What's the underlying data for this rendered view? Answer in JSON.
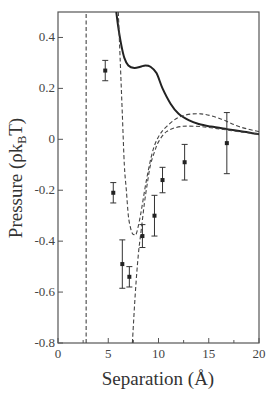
{
  "chart_data": {
    "type": "line",
    "title": "",
    "xlabel": "Separation (Å)",
    "ylabel": "Pressure (ρk_BT)",
    "ylabel_parts": {
      "main": "Pressure (ρk",
      "sub": "B",
      "end": "T)"
    },
    "xlim": [
      0,
      20
    ],
    "ylim": [
      -0.8,
      0.5
    ],
    "grid": false,
    "legend": "none",
    "x_ticks": [
      0,
      5,
      10,
      15,
      20
    ],
    "x_minor_ticks": [
      2.5,
      7.5,
      12.5,
      17.5
    ],
    "x_tick_labels": [
      "0",
      "5",
      "10",
      "15",
      "20"
    ],
    "y_ticks": [
      -0.8,
      -0.6,
      -0.4,
      -0.2,
      0,
      0.2,
      0.4
    ],
    "y_tick_labels": [
      "-0.8",
      "-0.6",
      "-0.4",
      "-0.2",
      "0",
      "0.2",
      "0.4"
    ],
    "series": [
      {
        "name": "solid-curve",
        "style": "solid",
        "x": [
          5.8,
          6.0,
          6.3,
          6.6,
          7.0,
          7.6,
          8.2,
          8.7,
          9.2,
          9.8,
          10.4,
          11.2,
          12.0,
          13.0,
          14.0,
          15.2,
          16.8,
          18.5,
          20.0
        ],
        "y": [
          0.5,
          0.44,
          0.37,
          0.32,
          0.29,
          0.28,
          0.285,
          0.29,
          0.285,
          0.26,
          0.2,
          0.14,
          0.1,
          0.075,
          0.06,
          0.05,
          0.04,
          0.03,
          0.02
        ]
      },
      {
        "name": "dashed-curve-with-minimum",
        "style": "dashed",
        "x": [
          6.0,
          6.2,
          6.4,
          6.6,
          6.8,
          7.0,
          7.2,
          7.4,
          7.6,
          7.8,
          8.2,
          8.8,
          9.4,
          10.0,
          10.8,
          12.2,
          14.2,
          16.2,
          18.0,
          20.0
        ],
        "y": [
          0.5,
          0.3,
          0.1,
          -0.1,
          -0.2,
          -0.3,
          -0.345,
          -0.37,
          -0.375,
          -0.37,
          -0.3,
          -0.16,
          -0.05,
          0.01,
          0.05,
          0.09,
          0.1,
          0.08,
          0.05,
          0.03
        ]
      },
      {
        "name": "dashed-curve-steep",
        "style": "dashed",
        "x": [
          7.4,
          7.7,
          8.0,
          8.3,
          8.6,
          8.9,
          9.2,
          9.6,
          10.0,
          10.8,
          12.2,
          14.2,
          16.2,
          18.0,
          20.0
        ],
        "y": [
          -0.8,
          -0.6,
          -0.45,
          -0.35,
          -0.25,
          -0.17,
          -0.1,
          -0.05,
          -0.01,
          0.03,
          0.05,
          0.05,
          0.04,
          0.03,
          0.02
        ]
      },
      {
        "name": "vertical-dashed-line",
        "style": "dashed",
        "x": [
          2.8,
          2.8
        ],
        "y": [
          -0.8,
          0.5
        ]
      },
      {
        "name": "data-points",
        "style": "markers-with-errorbars",
        "x": [
          4.7,
          5.5,
          6.4,
          7.1,
          8.4,
          9.6,
          10.4,
          12.6,
          16.8
        ],
        "y": [
          0.27,
          -0.21,
          -0.49,
          -0.54,
          -0.38,
          -0.3,
          -0.16,
          -0.09,
          -0.015
        ],
        "err": [
          0.04,
          0.04,
          0.095,
          0.04,
          0.045,
          0.08,
          0.05,
          0.07,
          0.12
        ]
      }
    ]
  }
}
